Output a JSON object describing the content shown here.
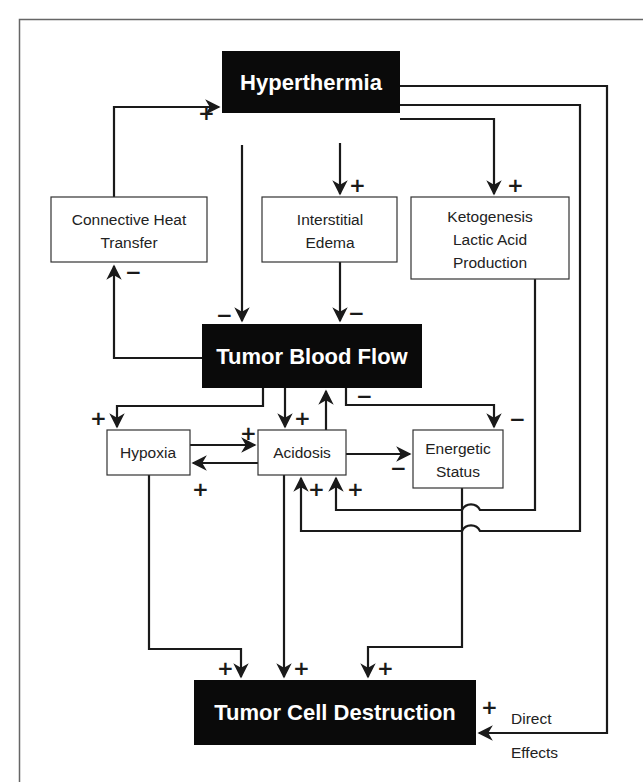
{
  "diagram": {
    "colors": {
      "dark_node_fill": "#0a0a0a",
      "dark_node_text": "#ffffff",
      "light_node_fill": "#ffffff",
      "line": "#1a1a1a",
      "frame": "#666666"
    },
    "nodes": {
      "hyperthermia": {
        "label": "Hyperthermia",
        "style": "dark"
      },
      "connective": {
        "lines": [
          "Connective Heat",
          "Transfer"
        ],
        "style": "light"
      },
      "interstitial": {
        "lines": [
          "Interstitial",
          "Edema"
        ],
        "style": "light"
      },
      "ketogenesis": {
        "lines": [
          "Ketogenesis",
          "Lactic Acid",
          "Production"
        ],
        "style": "light"
      },
      "blood_flow": {
        "label": "Tumor Blood Flow",
        "style": "dark"
      },
      "hypoxia": {
        "label": "Hypoxia",
        "style": "light"
      },
      "acidosis": {
        "label": "Acidosis",
        "style": "light"
      },
      "energetic": {
        "lines": [
          "Energetic",
          "Status"
        ],
        "style": "light"
      },
      "destruction": {
        "label": "Tumor Cell Destruction",
        "style": "dark"
      }
    },
    "edges": [
      {
        "from": "connective",
        "to": "hyperthermia",
        "sign": "+"
      },
      {
        "from": "hyperthermia",
        "to": "interstitial",
        "sign": "+"
      },
      {
        "from": "hyperthermia",
        "to": "ketogenesis",
        "sign": "+"
      },
      {
        "from": "hyperthermia",
        "to": "blood_flow",
        "sign": "−"
      },
      {
        "from": "interstitial",
        "to": "blood_flow",
        "sign": "−"
      },
      {
        "from": "blood_flow",
        "to": "connective",
        "sign": "−"
      },
      {
        "from": "blood_flow",
        "to": "hypoxia",
        "sign": "+"
      },
      {
        "from": "blood_flow",
        "to": "acidosis",
        "sign": "+"
      },
      {
        "from": "acidosis",
        "to": "blood_flow",
        "sign": ""
      },
      {
        "from": "blood_flow",
        "to": "energetic",
        "sign": "−"
      },
      {
        "from": "hypoxia",
        "to": "acidosis",
        "sign": "+"
      },
      {
        "from": "acidosis",
        "to": "hypoxia",
        "sign": "+"
      },
      {
        "from": "acidosis",
        "to": "energetic",
        "sign": "−"
      },
      {
        "from": "ketogenesis",
        "to": "acidosis",
        "sign": "+"
      },
      {
        "from": "hyperthermia",
        "to": "acidosis",
        "sign": "+"
      },
      {
        "from": "hyperthermia",
        "to": "energetic",
        "sign": "−"
      },
      {
        "from": "hypoxia",
        "to": "destruction",
        "sign": "+"
      },
      {
        "from": "acidosis",
        "to": "destruction",
        "sign": "+"
      },
      {
        "from": "energetic",
        "to": "destruction",
        "sign": "+"
      },
      {
        "from": "hyperthermia",
        "to": "destruction",
        "sign": "+",
        "label": "Direct Effects"
      }
    ],
    "signs": {
      "plus": "+",
      "minus": "−"
    },
    "direct_effects": {
      "line1": "Direct",
      "line2": "Effects"
    }
  }
}
